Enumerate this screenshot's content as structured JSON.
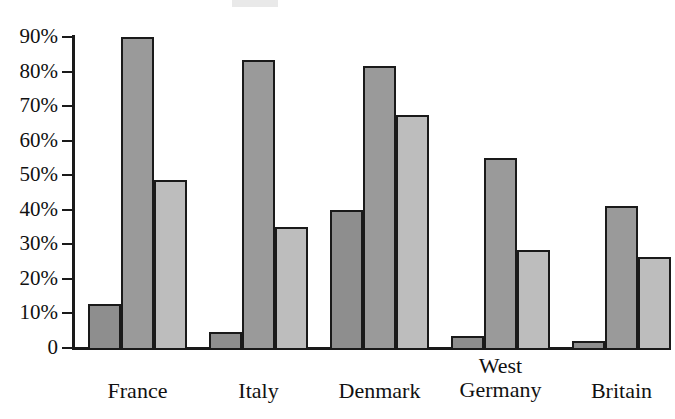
{
  "chart_data": {
    "type": "bar",
    "title": "",
    "subtitle": "",
    "xlabel": "",
    "ylabel": "",
    "ylim": [
      0,
      90
    ],
    "grid": false,
    "legend_position": "none",
    "categories": [
      "France",
      "Italy",
      "Denmark",
      "West\nGermany",
      "Britain"
    ],
    "y_ticks": [
      0,
      10,
      20,
      30,
      40,
      50,
      60,
      70,
      80,
      90
    ],
    "y_tick_labels": [
      "0",
      "10%",
      "20%",
      "30%",
      "40%",
      "50%",
      "60%",
      "70%",
      "80%",
      "90%"
    ],
    "series": [
      {
        "name": "series-1",
        "color": "#8e8e8e",
        "values": [
          12.7,
          4.5,
          40.0,
          3.5,
          2.0
        ]
      },
      {
        "name": "series-2",
        "color": "#9a9a9a",
        "values": [
          90.0,
          83.3,
          81.6,
          55.0,
          41.0
        ]
      },
      {
        "name": "series-3",
        "color": "#bdbdbd",
        "values": [
          48.5,
          35.0,
          67.5,
          28.5,
          26.2
        ]
      }
    ]
  },
  "style": {
    "axis_color": "#1a1a1a",
    "bar_outline": "#1a1a1a",
    "background": "#ffffff",
    "text_color": "#111111"
  }
}
